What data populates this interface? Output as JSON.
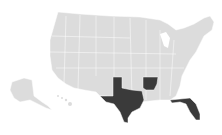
{
  "map": {
    "type": "choropleth",
    "region": "United States",
    "colors": {
      "background": "#ffffff",
      "default_fill": "#dcdcdc",
      "highlight_fill": "#3a3a3a",
      "border": "#ffffff"
    },
    "highlighted_states": [
      "Texas",
      "Arkansas",
      "Florida"
    ]
  }
}
